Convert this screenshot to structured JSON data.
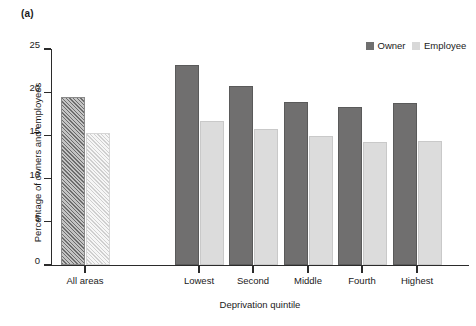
{
  "panel": {
    "label": "(a)"
  },
  "legend": {
    "position": "top-right",
    "entries": [
      {
        "name": "Owner",
        "color": "#6f6f6f"
      },
      {
        "name": "Employee",
        "color": "#d8d8d8"
      }
    ]
  },
  "axes": {
    "ylabel": "Percentage of owners and employees",
    "xlabel": "Deprivation quintile",
    "yticks": [
      0,
      5,
      10,
      15,
      20,
      25
    ],
    "ytick_labels": [
      "0",
      "5",
      "10",
      "15",
      "20",
      "25"
    ],
    "ylim": [
      0,
      25
    ],
    "grid": false
  },
  "chart_data": {
    "type": "bar",
    "title": "(a)",
    "xlabel": "Deprivation quintile",
    "ylabel": "Percentage of owners and employees",
    "ylim": [
      0,
      25
    ],
    "yticks": [
      0,
      5,
      10,
      15,
      20,
      25
    ],
    "grid": false,
    "legend_position": "top-right",
    "categories": [
      "All areas",
      "Lowest",
      "Second",
      "Middle",
      "Fourth",
      "Highest"
    ],
    "series": [
      {
        "name": "Owner",
        "color": "#706f6f",
        "values": [
          19.5,
          23.2,
          20.7,
          18.9,
          18.3,
          18.7
        ]
      },
      {
        "name": "Employee",
        "color": "#dcdcdc",
        "values": [
          15.3,
          16.7,
          15.8,
          14.9,
          14.2,
          14.4
        ]
      }
    ]
  },
  "render": {
    "plot_left": 51,
    "plot_right": 469,
    "plot_top": 49,
    "plot_bottom": 265,
    "group_centers": [
      85,
      199,
      253,
      308,
      362,
      417
    ],
    "bar_width": 24,
    "bar_gap": 1,
    "hatched_groups": [
      0
    ]
  }
}
